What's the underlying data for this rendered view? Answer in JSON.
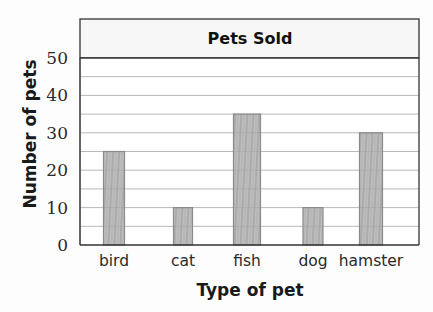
{
  "chart_data": {
    "type": "bar",
    "title": "Pets Sold",
    "xlabel": "Type of pet",
    "ylabel": "Number of pets",
    "categories": [
      "bird",
      "cat",
      "fish",
      "dog",
      "hamster"
    ],
    "values": [
      25,
      10,
      35,
      10,
      30
    ],
    "ylim": [
      0,
      50
    ],
    "yticks": [
      0,
      10,
      20,
      30,
      40,
      50
    ],
    "grid": true,
    "grid_step": 5,
    "style": "hand-shaded pencil bars",
    "bar_color": "#9a9a9a",
    "grid_color": "#b8b8b8",
    "frame_color": "#333333"
  }
}
